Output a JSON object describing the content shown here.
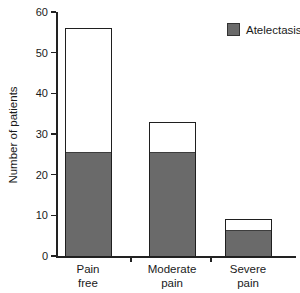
{
  "figure": {
    "background_color": "#ffffff",
    "text_color": "#1a1a1a",
    "axis_color": "#222222"
  },
  "legend": {
    "label": "Atelectasis",
    "swatch_color": "#6a6a6a",
    "swatch_border_color": "#333333"
  },
  "chart_data": {
    "type": "bar",
    "stacked": true,
    "title": "",
    "categories": [
      "Pain free",
      "Moderate pain",
      "Severe pain"
    ],
    "category_label_lines": [
      [
        "Pain",
        "free"
      ],
      [
        "Moderate",
        "pain"
      ],
      [
        "Severe",
        "pain"
      ]
    ],
    "series": [
      {
        "name": "Atelectasis",
        "values": [
          26,
          26,
          7
        ],
        "color": "#6a6a6a"
      }
    ],
    "bar_totals": [
      56,
      33,
      9
    ],
    "bar_fill_remainder_color": "#ffffff",
    "bar_outline_color": "#1f1f1f",
    "xlabel": "",
    "ylabel": "Number of patients",
    "ylim": [
      0,
      60
    ],
    "yticks": [
      0,
      10,
      20,
      30,
      40,
      50,
      60
    ],
    "grid": false,
    "legend_position": "top-right"
  }
}
